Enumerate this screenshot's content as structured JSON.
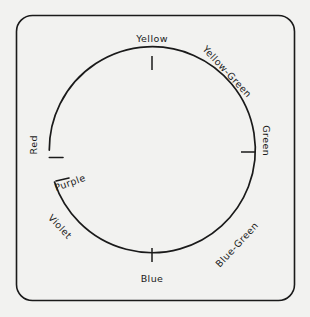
{
  "figure": {
    "kind": "color-wheel-diagram",
    "background_color": "#f2f2f0",
    "ink_color": "#1a1a1a",
    "border": {
      "shape": "rounded-rectangle",
      "corner_radius": 16
    },
    "wheel": {
      "shape": "circle-with-gap",
      "center_x": 152,
      "center_y": 159,
      "radius": 103,
      "gap_description": "open gap on the left side between Red and Purple",
      "gap_start_label": "Purple",
      "gap_end_label": "Red"
    },
    "ticks": [
      {
        "name": "tick-yellow",
        "position": "top",
        "angle_deg": 90
      },
      {
        "name": "tick-green",
        "position": "right",
        "angle_deg": 0
      },
      {
        "name": "tick-blue",
        "position": "bottom",
        "angle_deg": 270
      },
      {
        "name": "tick-red-end",
        "position": "upper-left-arc-end",
        "angle_deg": 180
      },
      {
        "name": "tick-purple-end",
        "position": "lower-left-arc-end",
        "angle_deg": 193
      }
    ],
    "labels": [
      {
        "id": "yellow",
        "text": "Yellow",
        "angle_deg": 90,
        "rotation_deg": 0
      },
      {
        "id": "yellow-green",
        "text": "Yellow-Green",
        "angle_deg": 45,
        "rotation_deg": 47
      },
      {
        "id": "green",
        "text": "Green",
        "angle_deg": 0,
        "rotation_deg": 90
      },
      {
        "id": "blue-green",
        "text": "Blue-Green",
        "angle_deg": 315,
        "rotation_deg": -47
      },
      {
        "id": "blue",
        "text": "Blue",
        "angle_deg": 270,
        "rotation_deg": 0
      },
      {
        "id": "violet",
        "text": "Violet",
        "angle_deg": 225,
        "rotation_deg": 47
      },
      {
        "id": "purple",
        "text": "Purple",
        "angle_deg": 200,
        "rotation_deg": -20
      },
      {
        "id": "red",
        "text": "Red",
        "angle_deg": 175,
        "rotation_deg": -90
      }
    ]
  }
}
